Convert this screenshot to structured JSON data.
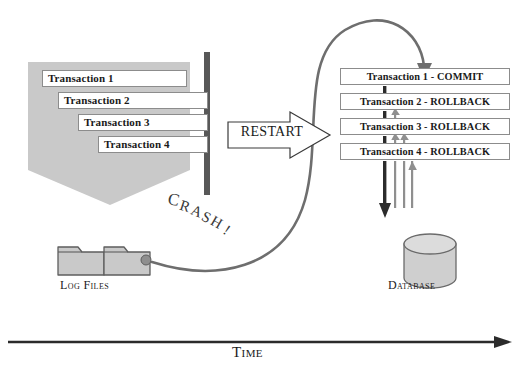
{
  "diagram": {
    "title_hidden": "",
    "colors": {
      "pentagon_fill": "#c9c9c9",
      "box_border": "#8c8c8c",
      "crash_bar": "#585858",
      "curve": "#6e6e6e",
      "dark_arrow": "#2b2b2b",
      "light_arrow": "#9a9a9a",
      "cylinder_fill": "#cfcfcf",
      "folder_fill": "#c9c9c9",
      "text": "#1a1a1a"
    }
  },
  "left": {
    "transactions": [
      {
        "label": "Transaction 1",
        "left": 42,
        "top": 70,
        "width": 145
      },
      {
        "label": "Transaction 2",
        "left": 58,
        "top": 92,
        "width": 150
      },
      {
        "label": "Transaction 3",
        "left": 78,
        "top": 114,
        "width": 130
      },
      {
        "label": "Transaction 4",
        "left": 98,
        "top": 136,
        "width": 110
      }
    ],
    "crash_text": "CRASH!",
    "log_files_label": "Log Files"
  },
  "center": {
    "restart_label": "RESTART"
  },
  "right": {
    "transactions": [
      {
        "label": "Transaction 1 - COMMIT",
        "top": 68
      },
      {
        "label": "Transaction 2 - ROLLBACK",
        "top": 93
      },
      {
        "label": "Transaction 3 - ROLLBACK",
        "top": 118
      },
      {
        "label": "Transaction 4 - ROLLBACK",
        "top": 143
      }
    ],
    "database_label": "Database"
  },
  "axis": {
    "time_label": "Time"
  }
}
